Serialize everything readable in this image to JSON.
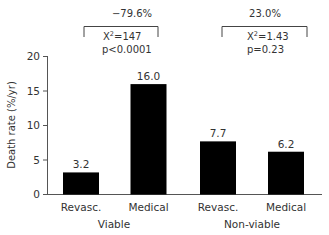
{
  "chart_data": {
    "type": "bar",
    "title": "",
    "xlabel": "",
    "ylabel": "Death rate (%/yr)",
    "ylim": [
      0,
      20
    ],
    "yticks": [
      0,
      5,
      10,
      15,
      20
    ],
    "grid": false,
    "legend": "none",
    "bar_color": "#000000",
    "categories": [
      "Revasc.",
      "Medical",
      "Revasc.",
      "Medical"
    ],
    "groups": [
      "Viable",
      "Non-viable"
    ],
    "values": [
      3.2,
      16.0,
      7.7,
      6.2
    ],
    "value_labels": [
      "3.2",
      "16.0",
      "7.7",
      "6.2"
    ],
    "annotations": [
      {
        "group": "Viable",
        "change": "−79.6%",
        "chi_label": "X",
        "chi_sup": "2",
        "chi_value": "=147",
        "p": "p<0.0001"
      },
      {
        "group": "Non-viable",
        "change": "23.0%",
        "chi_label": "X",
        "chi_sup": "2",
        "chi_value": "=1.43",
        "p": "p=0.23"
      }
    ]
  }
}
